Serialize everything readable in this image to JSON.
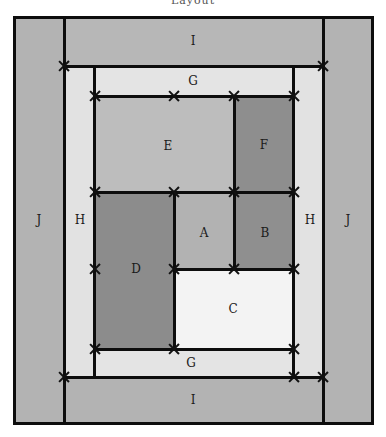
{
  "title": "Layout",
  "colors": {
    "outer_band": "#b3b3b3",
    "middle_band": "#e0e0e0",
    "light_gray": "#bcbcbc",
    "dark_gray": "#8f8f8f",
    "white_region": "#f2f2f2",
    "lines": "#0d0d0d"
  },
  "regions": [
    {
      "id": "I_top",
      "label": "I"
    },
    {
      "id": "I_bottom",
      "label": "I"
    },
    {
      "id": "J_left",
      "label": "J"
    },
    {
      "id": "J_right",
      "label": "J"
    },
    {
      "id": "H_left",
      "label": "H"
    },
    {
      "id": "H_right",
      "label": "H"
    },
    {
      "id": "G_top",
      "label": "G"
    },
    {
      "id": "G_bottom",
      "label": "G"
    },
    {
      "id": "E",
      "label": "E"
    },
    {
      "id": "F",
      "label": "F"
    },
    {
      "id": "A",
      "label": "A"
    },
    {
      "id": "B",
      "label": "B"
    },
    {
      "id": "C",
      "label": "C"
    },
    {
      "id": "D",
      "label": "D"
    }
  ]
}
